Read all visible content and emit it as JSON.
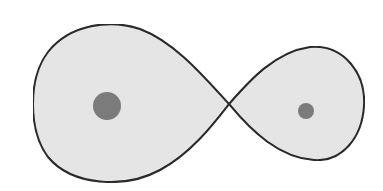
{
  "diagram": {
    "type": "roche-lobe-figure-eight",
    "colors": {
      "background": "#ffffff",
      "lobe_fill": "#e6e6e6",
      "outline": "#1a1a1a",
      "mass": "#7b7b7b"
    },
    "lobes": [
      {
        "name": "primary-lobe",
        "side": "left"
      },
      {
        "name": "secondary-lobe",
        "side": "right"
      }
    ],
    "masses": [
      {
        "name": "primary-mass",
        "cx": 107,
        "cy": 106,
        "r": 14
      },
      {
        "name": "secondary-mass",
        "cx": 306,
        "cy": 111,
        "r": 8
      }
    ],
    "crossing_point": {
      "x": 229,
      "y": 104
    }
  }
}
